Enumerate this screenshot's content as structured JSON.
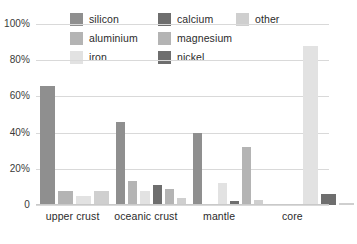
{
  "chart_data": {
    "type": "bar",
    "title": "",
    "subtitle": "",
    "xlabel": "",
    "ylabel": "",
    "ylim": [
      0,
      100
    ],
    "yticks": [
      "0",
      "20%",
      "40%",
      "60%",
      "80%",
      "100%"
    ],
    "ytick_values": [
      0,
      20,
      40,
      60,
      80,
      100
    ],
    "grid": true,
    "legend_position": "top",
    "categories": [
      "upper crust",
      "oceanic crust",
      "mantle",
      "core"
    ],
    "series": [
      {
        "name": "silicon",
        "color": "#8f8f8f",
        "values": [
          66,
          46,
          40,
          0
        ]
      },
      {
        "name": "aluminium",
        "color": "#b4b4b4",
        "values": [
          8,
          13,
          0,
          0
        ]
      },
      {
        "name": "iron",
        "color": "#e2e2e2",
        "values": [
          5,
          8,
          12,
          88
        ]
      },
      {
        "name": "calcium",
        "color": "#6e6e6e",
        "values": [
          0,
          11,
          2,
          0
        ]
      },
      {
        "name": "magnesium",
        "color": "#b4b4b4",
        "values": [
          0,
          9,
          32,
          0
        ]
      },
      {
        "name": "nickel",
        "color": "#6e6e6e",
        "values": [
          0,
          0,
          0,
          6
        ]
      },
      {
        "name": "other",
        "color": "#cfcfcf",
        "values": [
          8,
          4,
          3,
          1
        ]
      }
    ],
    "group_series": [
      [
        "silicon",
        "aluminium",
        "iron",
        "other"
      ],
      [
        "silicon",
        "aluminium",
        "iron",
        "calcium",
        "magnesium",
        "other"
      ],
      [
        "silicon",
        "aluminium",
        "iron",
        "calcium",
        "magnesium",
        "other"
      ],
      [
        "aluminium",
        "iron",
        "nickel",
        "other"
      ]
    ]
  },
  "legend": {
    "rows": [
      [
        {
          "label": "silicon",
          "color": "#8f8f8f"
        },
        {
          "label": "calcium",
          "color": "#6e6e6e"
        },
        {
          "label": "other",
          "color": "#cfcfcf"
        }
      ],
      [
        {
          "label": "aluminium",
          "color": "#b4b4b4"
        },
        {
          "label": "magnesium",
          "color": "#b4b4b4"
        }
      ],
      [
        {
          "label": "iron",
          "color": "#e2e2e2"
        },
        {
          "label": "nickel",
          "color": "#6e6e6e"
        }
      ]
    ]
  },
  "colors": {
    "gridline": "#d9d9d9",
    "text": "#2b2b2b",
    "background": "#ffffff"
  }
}
